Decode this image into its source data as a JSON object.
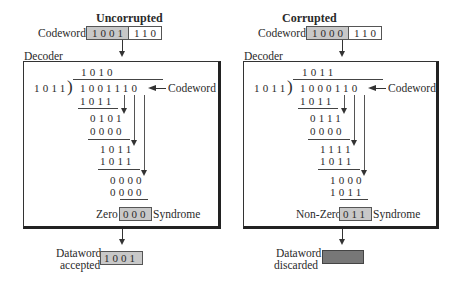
{
  "left": {
    "title": "Uncorrupted",
    "codeword_label": "Codeword",
    "codeword_data_bits": "1001",
    "codeword_check_bits": "110",
    "decoder_label": "Decoder",
    "quotient": "1010",
    "divisor": "1011",
    "dividend": "1001110",
    "codeword_pointer_label": "Codeword",
    "steps": [
      {
        "sub": "1011",
        "remainder": "0101"
      },
      {
        "sub": "0000",
        "remainder": "1011"
      },
      {
        "sub": "1011",
        "remainder": "0000"
      },
      {
        "sub": "0000",
        "remainder": ""
      }
    ],
    "rows": [
      "1011",
      "0101",
      "0000",
      "1011",
      "1011",
      "0000",
      "0000"
    ],
    "syndrome_prefix": "Zero",
    "syndrome": "000",
    "syndrome_label": "Syndrome",
    "dataword_label_1": "Dataword",
    "dataword_label_2": "accepted",
    "dataword": "1001"
  },
  "right": {
    "title": "Corrupted",
    "codeword_label": "Codeword",
    "codeword_data_bits": "1000",
    "codeword_check_bits": "110",
    "decoder_label": "Decoder",
    "quotient": "1011",
    "divisor": "1011",
    "dividend": "1000110",
    "codeword_pointer_label": "Codeword",
    "rows": [
      "1011",
      "0111",
      "0000",
      "1111",
      "1011",
      "1000",
      "1011"
    ],
    "syndrome_prefix": "Non-Zero",
    "syndrome": "011",
    "syndrome_label": "Syndrome",
    "dataword_label_1": "Dataword",
    "dataword_label_2": "discarded",
    "dataword": ""
  },
  "colors": {
    "grey_fill": "#c8c8c8",
    "discard_fill": "#777777",
    "line": "#333333"
  }
}
